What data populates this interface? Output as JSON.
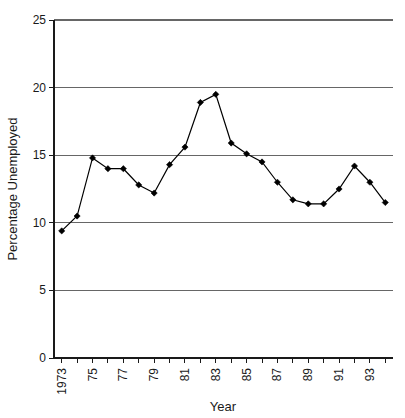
{
  "chart_data": {
    "type": "line",
    "title": "",
    "subtitle": "",
    "xlabel": "Year",
    "ylabel": "Percentage Unemployed",
    "xlim": [
      1972.5,
      1994.5
    ],
    "ylim": [
      0,
      25
    ],
    "ytick_values": [
      0,
      5,
      10,
      15,
      20,
      25
    ],
    "ytick_labels": [
      "0",
      "5",
      "10",
      "15",
      "20",
      "25"
    ],
    "xtick_values": [
      1973,
      1974,
      1975,
      1976,
      1977,
      1978,
      1979,
      1980,
      1981,
      1982,
      1983,
      1984,
      1985,
      1986,
      1987,
      1988,
      1989,
      1990,
      1991,
      1992,
      1993,
      1994
    ],
    "xtick_labels": [
      "1973",
      "",
      "75",
      "",
      "77",
      "",
      "79",
      "",
      "81",
      "",
      "83",
      "",
      "85",
      "",
      "87",
      "",
      "89",
      "",
      "91",
      "",
      "93",
      ""
    ],
    "xtick_label_rotation": -90,
    "grid": "horizontal",
    "grid_color": "#666666",
    "legend": "none",
    "marker": "diamond",
    "marker_color": "#000000",
    "line_color": "#000000",
    "x": [
      1973,
      1974,
      1975,
      1976,
      1977,
      1978,
      1979,
      1980,
      1981,
      1982,
      1983,
      1984,
      1985,
      1986,
      1987,
      1988,
      1989,
      1990,
      1991,
      1992,
      1993,
      1994
    ],
    "values": [
      9.4,
      10.5,
      14.8,
      14.0,
      14.0,
      12.8,
      12.2,
      14.3,
      15.6,
      18.9,
      19.5,
      15.9,
      15.1,
      14.5,
      13.0,
      11.7,
      11.4,
      11.4,
      12.5,
      14.2,
      13.0,
      11.5
    ],
    "series": [
      {
        "name": "Percentage Unemployed",
        "values": [
          9.4,
          10.5,
          14.8,
          14.0,
          14.0,
          12.8,
          12.2,
          14.3,
          15.6,
          18.9,
          19.5,
          15.9,
          15.1,
          14.5,
          13.0,
          11.7,
          11.4,
          11.4,
          12.5,
          14.2,
          13.0,
          11.5
        ]
      }
    ],
    "annotations": []
  },
  "plot_geometry": {
    "left": 54,
    "right": 393,
    "top": 20,
    "bottom": 358
  }
}
